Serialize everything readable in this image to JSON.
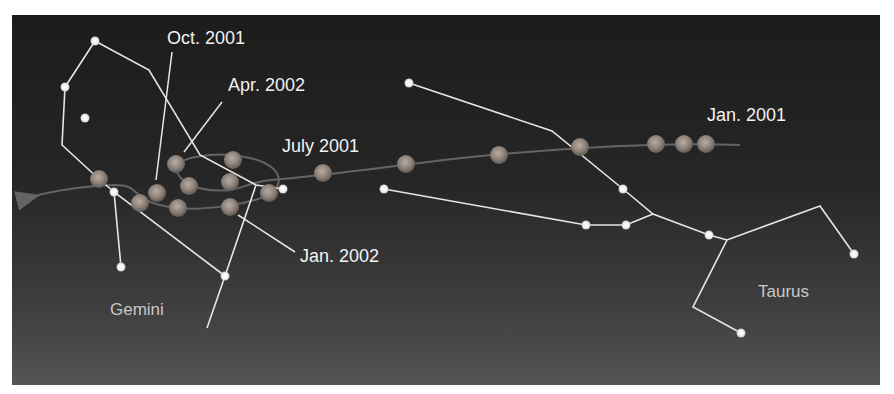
{
  "figure": {
    "colors": {
      "background_top": "#1c1c1c",
      "background_bottom": "#555555",
      "lines": "#e8e8e8",
      "stars": "#ffffff",
      "planet": "#9a8f86",
      "path": "#6b6b6b"
    }
  },
  "labels": {
    "oct_2001": "Oct. 2001",
    "apr_2002": "Apr. 2002",
    "july_2001": "July 2001",
    "jan_2001": "Jan. 2001",
    "jan_2002": "Jan. 2002",
    "gemini": "Gemini",
    "taurus": "Taurus"
  },
  "planet_positions": [
    [
      99,
      179
    ],
    [
      140,
      203
    ],
    [
      157,
      193
    ],
    [
      176,
      164
    ],
    [
      189,
      186
    ],
    [
      178,
      208
    ],
    [
      230,
      182
    ],
    [
      233,
      160
    ],
    [
      230,
      207
    ],
    [
      269,
      193
    ],
    [
      323,
      173
    ],
    [
      406,
      164
    ],
    [
      499,
      155
    ],
    [
      580,
      147
    ],
    [
      656,
      144
    ],
    [
      684,
      144
    ],
    [
      706,
      144
    ]
  ],
  "stars": [
    [
      95,
      41
    ],
    [
      65,
      87
    ],
    [
      85,
      118
    ],
    [
      114,
      192
    ],
    [
      121,
      267
    ],
    [
      225,
      276
    ],
    [
      283,
      189
    ],
    [
      409,
      83
    ],
    [
      384,
      189
    ],
    [
      623,
      189
    ],
    [
      586,
      225
    ],
    [
      626,
      225
    ],
    [
      709,
      235
    ],
    [
      854,
      254
    ],
    [
      741,
      333
    ]
  ]
}
